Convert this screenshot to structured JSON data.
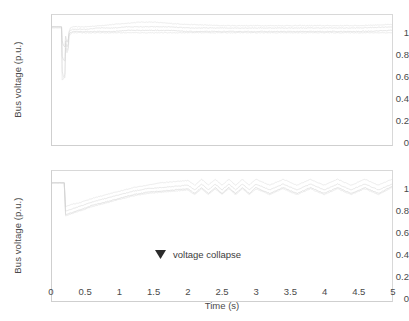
{
  "figure": {
    "width": 409,
    "height": 321,
    "background": "#ffffff",
    "trace_color": "#d0d0d0",
    "axis_color": "#cfcfcf",
    "text_color": "#4a4a4a"
  },
  "xlabel": "Time (s)",
  "xticks": [
    "0",
    "0.5",
    "1",
    "1.5",
    "2",
    "2.5",
    "3",
    "3.5",
    "4",
    "4.5",
    "5"
  ],
  "yticks": [
    "1",
    "0.8",
    "0.6",
    "0.4",
    "0.2",
    "0"
  ],
  "ylabel": "Bus voltage (p.u.)",
  "annotation": {
    "text": "voltage collapse",
    "icon": "down-arrowhead-icon"
  },
  "chart_data": [
    {
      "type": "line",
      "panel": "top",
      "title": "",
      "xlabel": "",
      "ylabel": "Bus voltage (p.u.)",
      "xlim": [
        0,
        5
      ],
      "ylim": [
        0,
        1.1
      ],
      "xticks": [
        0,
        0.5,
        1,
        1.5,
        2,
        2.5,
        3,
        3.5,
        4,
        4.5,
        5
      ],
      "yticks": [
        0,
        0.2,
        0.4,
        0.6,
        0.8,
        1
      ],
      "grid": false,
      "legend": null,
      "description": "Stable case: bus voltages dip during a fault near t=0.15-0.25 s then recover and settle close to 1.0 p.u.",
      "series": [
        {
          "name": "bus-1",
          "x": [
            0,
            0.05,
            0.1,
            0.14,
            0.15,
            0.17,
            0.19,
            0.2,
            0.22,
            0.24,
            0.25,
            0.27,
            0.3,
            0.35,
            0.4,
            0.5,
            0.7,
            0.9,
            1.1,
            1.3,
            1.5,
            1.7,
            2.0,
            2.5,
            3.0,
            3.5,
            4.0,
            4.5,
            5.0
          ],
          "y": [
            1.0,
            1.0,
            1.0,
            1.0,
            0.62,
            0.58,
            0.57,
            0.86,
            0.8,
            0.83,
            0.96,
            0.99,
            1.0,
            1.0,
            1.0,
            1.0,
            1.01,
            1.02,
            1.03,
            1.04,
            1.04,
            1.03,
            1.02,
            1.01,
            1.01,
            1.01,
            1.01,
            1.01,
            1.02
          ]
        },
        {
          "name": "bus-2",
          "x": [
            0,
            0.05,
            0.1,
            0.14,
            0.15,
            0.17,
            0.19,
            0.2,
            0.22,
            0.24,
            0.25,
            0.27,
            0.3,
            0.35,
            0.4,
            0.5,
            0.7,
            0.9,
            1.1,
            1.3,
            1.5,
            1.7,
            2.0,
            2.5,
            3.0,
            3.5,
            4.0,
            4.5,
            5.0
          ],
          "y": [
            1.0,
            1.0,
            1.0,
            1.0,
            0.75,
            0.72,
            0.71,
            0.88,
            0.83,
            0.86,
            0.95,
            0.97,
            0.98,
            0.98,
            0.98,
            0.98,
            0.99,
            0.99,
            1.0,
            1.0,
            1.0,
            1.0,
            0.99,
            0.99,
            0.99,
            0.99,
            0.99,
            0.99,
            1.0
          ]
        },
        {
          "name": "bus-3",
          "x": [
            0,
            0.05,
            0.1,
            0.14,
            0.15,
            0.17,
            0.19,
            0.2,
            0.22,
            0.24,
            0.25,
            0.27,
            0.3,
            0.35,
            0.4,
            0.5,
            0.7,
            0.9,
            1.1,
            1.3,
            1.5,
            1.7,
            2.0,
            2.5,
            3.0,
            3.5,
            4.0,
            4.5,
            5.0
          ],
          "y": [
            1.0,
            1.0,
            1.0,
            1.0,
            0.88,
            0.84,
            0.83,
            0.92,
            0.87,
            0.9,
            0.94,
            0.95,
            0.96,
            0.96,
            0.96,
            0.96,
            0.96,
            0.96,
            0.97,
            0.97,
            0.97,
            0.97,
            0.96,
            0.96,
            0.96,
            0.96,
            0.96,
            0.96,
            0.97
          ]
        },
        {
          "name": "bus-4",
          "x": [
            0,
            0.05,
            0.1,
            0.14,
            0.15,
            0.17,
            0.19,
            0.2,
            0.22,
            0.24,
            0.25,
            0.27,
            0.3,
            0.35,
            0.4,
            0.5,
            0.7,
            0.9,
            1.1,
            1.3,
            1.5,
            1.7,
            2.0,
            2.5,
            3.0,
            3.5,
            4.0,
            4.5,
            5.0
          ],
          "y": [
            0.99,
            0.99,
            0.99,
            0.99,
            0.55,
            0.56,
            0.6,
            0.82,
            0.78,
            0.81,
            0.92,
            0.94,
            0.95,
            0.95,
            0.95,
            0.95,
            0.95,
            0.95,
            0.95,
            0.95,
            0.95,
            0.95,
            0.95,
            0.95,
            0.95,
            0.95,
            0.95,
            0.95,
            0.95
          ]
        }
      ]
    },
    {
      "type": "line",
      "panel": "bottom",
      "title": "",
      "xlabel": "Time (s)",
      "ylabel": "Bus voltage (p.u.)",
      "xlim": [
        0,
        5
      ],
      "ylim": [
        0,
        1.1
      ],
      "xticks": [
        0,
        0.5,
        1,
        1.5,
        2,
        2.5,
        3,
        3.5,
        4,
        4.5,
        5
      ],
      "yticks": [
        0,
        0.2,
        0.4,
        0.6,
        0.8,
        1
      ],
      "grid": false,
      "legend": null,
      "annotations": [
        {
          "text": "voltage collapse",
          "x": 1.7,
          "y": 0.22
        }
      ],
      "description": "Voltage collapse case: voltages drop sharply at t=0.2 s, slowly ramp back up and then exhibit sustained oscillations after about 2 s.",
      "series": [
        {
          "name": "bus-1",
          "x": [
            0,
            0.1,
            0.18,
            0.2,
            0.25,
            0.3,
            0.4,
            0.5,
            0.6,
            0.8,
            1.0,
            1.2,
            1.4,
            1.6,
            1.8,
            2.0,
            2.1,
            2.2,
            2.3,
            2.4,
            2.5,
            2.6,
            2.7,
            2.8,
            2.9,
            3.0,
            3.2,
            3.4,
            3.6,
            3.8,
            4.0,
            4.2,
            4.4,
            4.6,
            4.8,
            5.0
          ],
          "y": [
            1.0,
            1.0,
            1.0,
            0.8,
            0.81,
            0.82,
            0.83,
            0.85,
            0.87,
            0.9,
            0.93,
            0.96,
            0.98,
            1.0,
            1.01,
            1.02,
            0.98,
            1.03,
            0.98,
            1.03,
            0.98,
            1.03,
            0.98,
            1.03,
            0.98,
            1.03,
            0.98,
            1.03,
            0.98,
            1.03,
            0.98,
            1.03,
            0.98,
            1.03,
            0.98,
            1.03
          ]
        },
        {
          "name": "bus-2",
          "x": [
            0,
            0.1,
            0.18,
            0.2,
            0.25,
            0.3,
            0.4,
            0.5,
            0.6,
            0.8,
            1.0,
            1.2,
            1.4,
            1.6,
            1.8,
            2.0,
            2.1,
            2.2,
            2.3,
            2.4,
            2.5,
            2.6,
            2.7,
            2.8,
            2.9,
            3.0,
            3.2,
            3.4,
            3.6,
            3.8,
            4.0,
            4.2,
            4.4,
            4.6,
            4.8,
            5.0
          ],
          "y": [
            1.0,
            1.0,
            1.0,
            0.76,
            0.77,
            0.78,
            0.8,
            0.82,
            0.84,
            0.87,
            0.9,
            0.93,
            0.95,
            0.96,
            0.97,
            0.98,
            0.94,
            0.99,
            0.94,
            0.99,
            0.94,
            0.99,
            0.94,
            0.99,
            0.94,
            0.99,
            0.94,
            0.99,
            0.94,
            0.99,
            0.94,
            0.99,
            0.94,
            0.99,
            0.94,
            0.99
          ]
        },
        {
          "name": "bus-3",
          "x": [
            0,
            0.1,
            0.18,
            0.2,
            0.25,
            0.3,
            0.4,
            0.5,
            0.6,
            0.8,
            1.0,
            1.2,
            1.4,
            1.6,
            1.8,
            2.0,
            2.1,
            2.2,
            2.3,
            2.4,
            2.5,
            2.6,
            2.7,
            2.8,
            2.9,
            3.0,
            3.2,
            3.4,
            3.6,
            3.8,
            4.0,
            4.2,
            4.4,
            4.6,
            4.8,
            5.0
          ],
          "y": [
            1.0,
            1.0,
            1.0,
            0.73,
            0.74,
            0.75,
            0.77,
            0.79,
            0.81,
            0.84,
            0.87,
            0.9,
            0.92,
            0.93,
            0.94,
            0.95,
            0.91,
            0.96,
            0.91,
            0.96,
            0.91,
            0.96,
            0.91,
            0.96,
            0.91,
            0.96,
            0.91,
            0.96,
            0.91,
            0.96,
            0.91,
            0.96,
            0.91,
            0.96,
            0.91,
            0.97
          ]
        },
        {
          "name": "bus-4",
          "x": [
            0,
            0.1,
            0.18,
            0.2,
            0.25,
            0.3,
            0.4,
            0.5,
            0.6,
            0.8,
            1.0,
            1.2,
            1.4,
            1.6,
            1.8,
            2.0,
            2.1,
            2.2,
            2.3,
            2.4,
            2.5,
            2.6,
            2.7,
            2.8,
            2.9,
            3.0,
            3.2,
            3.4,
            3.6,
            3.8,
            4.0,
            4.2,
            4.4,
            4.6,
            4.8,
            5.0
          ],
          "y": [
            1.0,
            1.0,
            1.0,
            0.72,
            0.73,
            0.74,
            0.76,
            0.78,
            0.8,
            0.83,
            0.86,
            0.89,
            0.91,
            0.92,
            0.93,
            0.94,
            0.9,
            0.95,
            0.9,
            0.95,
            0.9,
            0.95,
            0.9,
            0.95,
            0.9,
            0.95,
            0.9,
            0.95,
            0.9,
            0.95,
            0.9,
            0.95,
            0.9,
            0.95,
            0.9,
            0.96
          ]
        }
      ]
    }
  ]
}
